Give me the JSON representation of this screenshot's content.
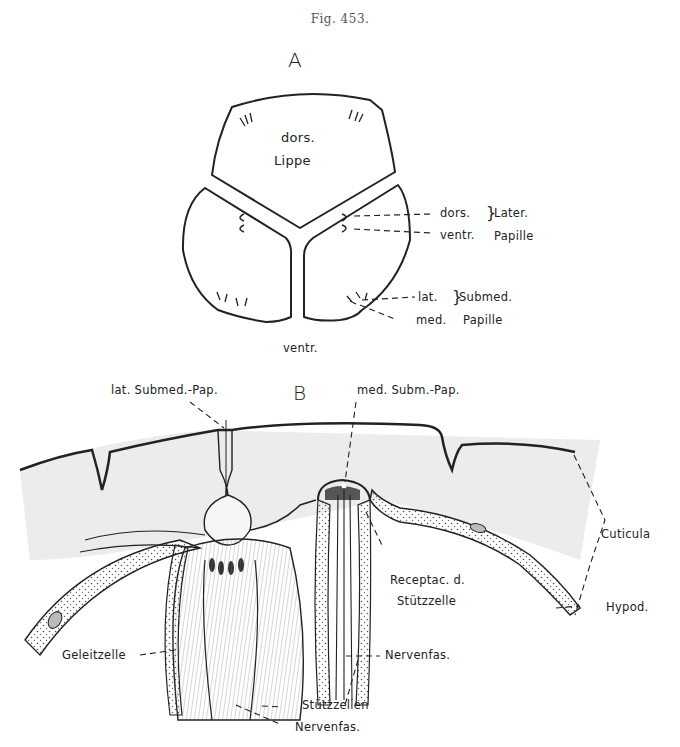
{
  "figure": {
    "caption": "Fig. 453.",
    "panel_a": {
      "label": "A",
      "center_labels": {
        "dors": "dors.",
        "lippe": "Lippe",
        "ventr": "ventr."
      },
      "annotations": {
        "dors": "dors.",
        "ventr": "ventr.",
        "later": "Later.",
        "papille_1": "Papille",
        "lat": "lat.",
        "med": "med.",
        "submed": "Submed.",
        "papille_2": "Papille"
      }
    },
    "panel_b": {
      "label": "B",
      "annotations": {
        "lat_submed_pap": "lat. Submed.-Pap.",
        "med_subm_pap": "med. Subm.-Pap.",
        "cuticula": "Cuticula",
        "receptac_1": "Receptac. d.",
        "receptac_2": "Stützzelle",
        "hypod": "Hypod.",
        "geleitzelle": "Geleitzelle",
        "nervenfas_right": "Nervenfas.",
        "stutzzellen": "Stützzellen",
        "nervenfas_bottom": "Nervenfas."
      }
    },
    "colors": {
      "ink": "#222222",
      "stipple": "#888888",
      "shade": "#cfcfcf",
      "dark_fill": "#333333"
    }
  }
}
